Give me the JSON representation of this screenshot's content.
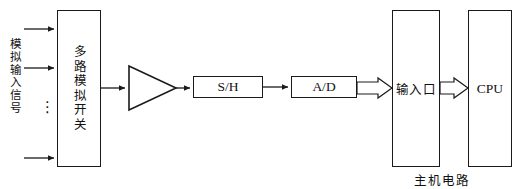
{
  "diagram": {
    "line_color": "#1a1a1a",
    "background": "#ffffff"
  },
  "input_section": {
    "label": "模拟输入信号",
    "ellipsis": "⋮",
    "channel_count": 3
  },
  "blocks": {
    "mux": {
      "label": "多路模拟开关"
    },
    "amplifier": {
      "label": "",
      "shape": "triangle-amplifier"
    },
    "sample_hold": {
      "label": "S/H"
    },
    "adc": {
      "label": "A/D"
    },
    "input_port": {
      "label": "输入口"
    },
    "cpu": {
      "label": "CPU"
    }
  },
  "host_circuit": {
    "caption": "主机电路"
  },
  "connectors": {
    "line_arrow": "arrow-head",
    "block_arrow": "hollow-block-arrow"
  }
}
